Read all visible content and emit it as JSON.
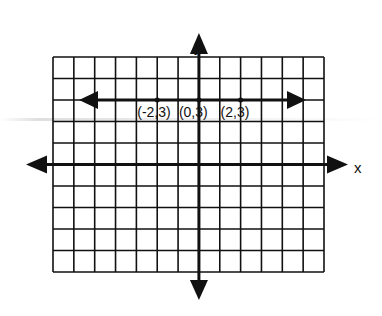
{
  "diagram": {
    "type": "coordinate-plane",
    "axes": {
      "x_label": "x",
      "y_label": "y"
    },
    "grid": {
      "columns": 13,
      "rows": 10,
      "unit": 1,
      "x_range": [
        -7,
        6
      ],
      "y_range": [
        -5,
        5
      ]
    },
    "line": {
      "description": "horizontal line y = 3 with arrows on both ends",
      "equation": "y = 3"
    },
    "points": [
      {
        "label": "(-2,3)",
        "x": -2,
        "y": 3
      },
      {
        "label": "(0,3)",
        "x": 0,
        "y": 3
      },
      {
        "label": "(2,3)",
        "x": 2,
        "y": 3
      }
    ],
    "colors": {
      "ink": "#111111",
      "background": "#ffffff"
    }
  }
}
